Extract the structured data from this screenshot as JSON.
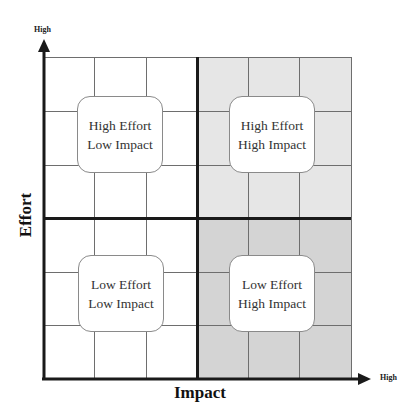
{
  "diagram": {
    "type": "2x2 effort-impact matrix",
    "y_axis": {
      "title": "Effort",
      "end_label": "High"
    },
    "x_axis": {
      "title": "Impact",
      "end_label": "High"
    },
    "quadrants": [
      {
        "position": "top-left",
        "line1": "High Effort",
        "line2": "Low Impact",
        "fill": "#ffffff"
      },
      {
        "position": "top-right",
        "line1": "High Effort",
        "line2": "High Impact",
        "fill": "#e6e6e6"
      },
      {
        "position": "bottom-left",
        "line1": "Low Effort",
        "line2": "Low Impact",
        "fill": "#ffffff"
      },
      {
        "position": "bottom-right",
        "line1": "Low Effort",
        "line2": "High Impact",
        "fill": "#d4d4d4"
      }
    ],
    "colors": {
      "axis": "#1a1a1a",
      "gridline": "#6e6e6e",
      "box_border": "#8a8a8a"
    }
  }
}
